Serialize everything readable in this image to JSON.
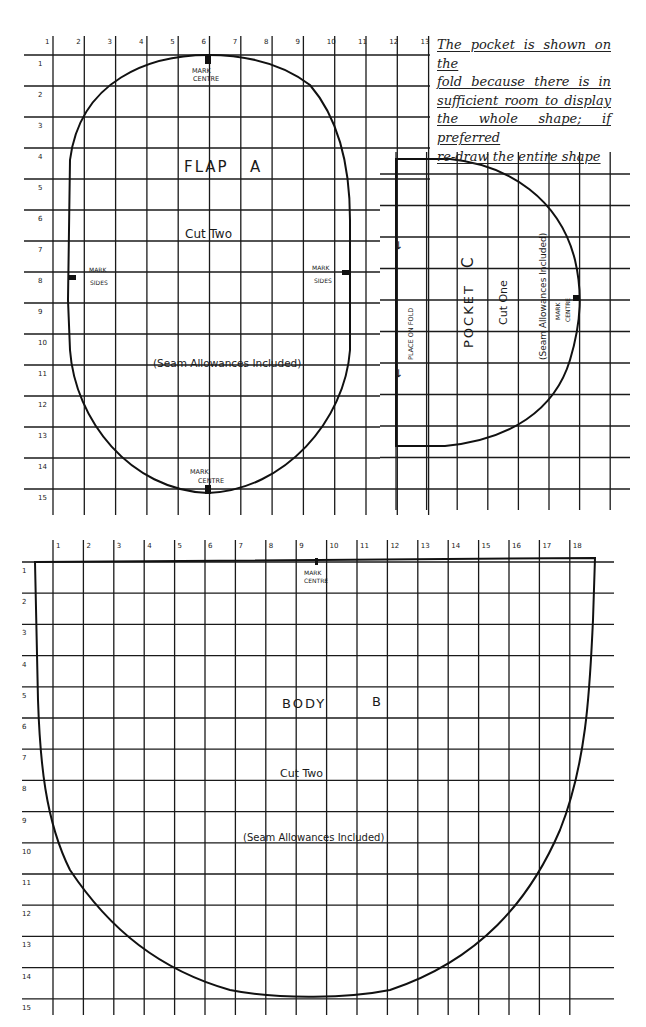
{
  "note": {
    "lines": [
      "The pocket is shown on the",
      "fold because there is in",
      "sufficient room to display",
      "the whole shape; if preferred",
      "re-draw the entire shape"
    ]
  },
  "flap": {
    "title": "FLAP",
    "letter": "A",
    "cut": "Cut Two",
    "seam": "(Seam Allowances Included)",
    "mark_centre_top": [
      "MARK",
      "CENTRE"
    ],
    "mark_centre_bottom": [
      "MARK",
      "CENTRE"
    ],
    "mark_sides_left": [
      "MARK",
      "SIDES"
    ],
    "mark_sides_right": [
      "MARK",
      "SIDES"
    ],
    "col_labels": [
      "1",
      "2",
      "3",
      "4",
      "5",
      "6",
      "7",
      "8",
      "9",
      "10",
      "11",
      "12",
      "13"
    ],
    "row_labels": [
      "1",
      "2",
      "3",
      "4",
      "5",
      "6",
      "7",
      "8",
      "9",
      "10",
      "11",
      "12",
      "13",
      "14",
      "15"
    ]
  },
  "pocket": {
    "title": "POCKET",
    "letter": "C",
    "cut": "Cut One",
    "seam": "(Seam Allowances Included)",
    "fold": "PLACE ON FOLD",
    "arrow": "←",
    "mark_centre": [
      "MARK",
      "CENTRE"
    ]
  },
  "body": {
    "title": "BODY",
    "letter": "B",
    "cut": "Cut Two",
    "seam": "(Seam Allowances Included)",
    "mark_centre": [
      "MARK",
      "CENTRE"
    ],
    "col_labels": [
      "1",
      "2",
      "3",
      "4",
      "5",
      "6",
      "7",
      "8",
      "9",
      "10",
      "11",
      "12",
      "13",
      "14",
      "15",
      "16",
      "17",
      "18"
    ],
    "row_labels": [
      "1",
      "2",
      "3",
      "4",
      "5",
      "6",
      "7",
      "8",
      "9",
      "10",
      "11",
      "12",
      "13",
      "14",
      "15"
    ]
  },
  "colors": {
    "ink": "#1a1a1a",
    "paper": "#ffffff"
  }
}
